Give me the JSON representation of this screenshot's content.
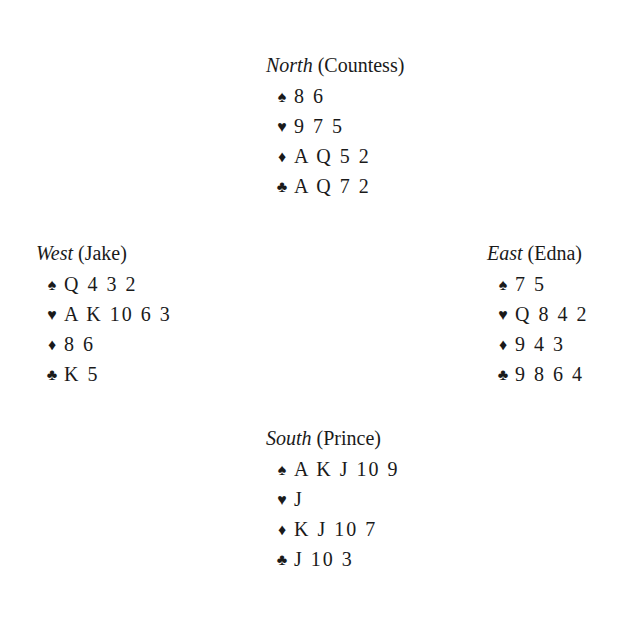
{
  "hands": {
    "north": {
      "direction": "North",
      "player": "(Countess)",
      "suits": [
        {
          "icon": "spade-icon",
          "glyph": "♠",
          "cards": "8 6"
        },
        {
          "icon": "heart-icon",
          "glyph": "♥",
          "cards": "9 7 5"
        },
        {
          "icon": "diamond-icon",
          "glyph": "♦",
          "cards": "A Q 5 2"
        },
        {
          "icon": "club-icon",
          "glyph": "♣",
          "cards": "A Q 7 2"
        }
      ]
    },
    "west": {
      "direction": "West",
      "player": "(Jake)",
      "suits": [
        {
          "icon": "spade-icon",
          "glyph": "♠",
          "cards": "Q 4 3 2"
        },
        {
          "icon": "heart-icon",
          "glyph": "♥",
          "cards": "A K 10 6 3"
        },
        {
          "icon": "diamond-icon",
          "glyph": "♦",
          "cards": "8 6"
        },
        {
          "icon": "club-icon",
          "glyph": "♣",
          "cards": "K 5"
        }
      ]
    },
    "east": {
      "direction": "East",
      "player": "(Edna)",
      "suits": [
        {
          "icon": "spade-icon",
          "glyph": "♠",
          "cards": "7 5"
        },
        {
          "icon": "heart-icon",
          "glyph": "♥",
          "cards": "Q 8 4 2"
        },
        {
          "icon": "diamond-icon",
          "glyph": "♦",
          "cards": "9 4 3"
        },
        {
          "icon": "club-icon",
          "glyph": "♣",
          "cards": "9 8 6 4"
        }
      ]
    },
    "south": {
      "direction": "South",
      "player": "(Prince)",
      "suits": [
        {
          "icon": "spade-icon",
          "glyph": "♠",
          "cards": "A K J 10 9"
        },
        {
          "icon": "heart-icon",
          "glyph": "♥",
          "cards": "J"
        },
        {
          "icon": "diamond-icon",
          "glyph": "♦",
          "cards": "K J 10 7"
        },
        {
          "icon": "club-icon",
          "glyph": "♣",
          "cards": "J 10 3"
        }
      ]
    }
  }
}
